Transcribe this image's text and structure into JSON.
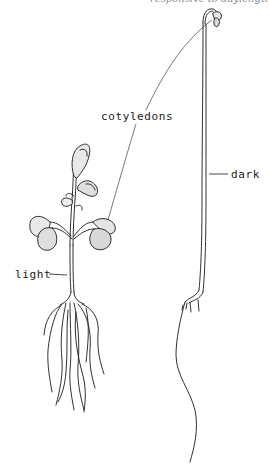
{
  "figure": {
    "top_cutoff_text": "responsive to daylength",
    "labels": {
      "cotyledons": "cotyledons",
      "dark": "dark",
      "light": "light"
    },
    "colors": {
      "ink": "#1a1a1a",
      "leader_line": "#555555",
      "background": "#ffffff",
      "leaf_shade": "#d8d8d8"
    }
  }
}
